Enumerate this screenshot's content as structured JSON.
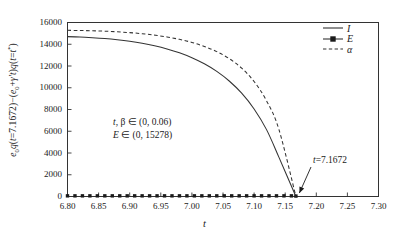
{
  "chart_data": {
    "type": "line",
    "title": "",
    "xlabel": "t",
    "ylabel": "e₀q(t=7.1672)−(e₀+γ't)q(t=t*)",
    "xlim": [
      6.8,
      7.3
    ],
    "ylim": [
      0,
      16000
    ],
    "xticks": [
      "6.80",
      "6.85",
      "6.90",
      "6.95",
      "7.00",
      "7.05",
      "7.10",
      "7.15",
      "7.20",
      "7.25",
      "7.30"
    ],
    "xtick_values": [
      6.8,
      6.85,
      6.9,
      6.95,
      7.0,
      7.05,
      7.1,
      7.15,
      7.2,
      7.25,
      7.3
    ],
    "yticks": [
      "0",
      "2000",
      "4000",
      "6000",
      "8000",
      "10000",
      "12000",
      "14000",
      "16000"
    ],
    "ytick_values": [
      0,
      2000,
      4000,
      6000,
      8000,
      10000,
      12000,
      14000,
      16000
    ],
    "grid": false,
    "legend_position": "top-right",
    "series": [
      {
        "name": "I",
        "style": "solid",
        "marker": "none",
        "color": "#333333",
        "x": [
          6.8,
          6.82,
          6.84,
          6.86,
          6.88,
          6.9,
          6.92,
          6.94,
          6.96,
          6.98,
          7.0,
          7.02,
          7.04,
          7.06,
          7.08,
          7.1,
          7.12,
          7.14,
          7.1672
        ],
        "values": [
          14700,
          14660,
          14600,
          14520,
          14410,
          14270,
          14090,
          13860,
          13570,
          13210,
          12760,
          12200,
          11500,
          10620,
          9500,
          8050,
          6150,
          3600,
          0
        ]
      },
      {
        "name": "E",
        "style": "solid",
        "marker": "square",
        "color": "#1a1a1a",
        "x": [
          6.8,
          6.812,
          6.824,
          6.836,
          6.848,
          6.86,
          6.872,
          6.884,
          6.896,
          6.908,
          6.92,
          6.932,
          6.944,
          6.956,
          6.968,
          6.98,
          6.992,
          7.004,
          7.016,
          7.028,
          7.04,
          7.052,
          7.064,
          7.076,
          7.088,
          7.1,
          7.112,
          7.124,
          7.136,
          7.148,
          7.16,
          7.1672
        ],
        "values": [
          60,
          60,
          60,
          60,
          60,
          60,
          60,
          60,
          60,
          60,
          60,
          60,
          60,
          60,
          60,
          60,
          60,
          60,
          60,
          60,
          60,
          60,
          60,
          60,
          60,
          60,
          60,
          60,
          60,
          60,
          60,
          40
        ]
      },
      {
        "name": "α",
        "style": "dashed",
        "marker": "none",
        "color": "#333333",
        "x": [
          6.8,
          6.82,
          6.84,
          6.86,
          6.88,
          6.9,
          6.92,
          6.94,
          6.96,
          6.98,
          7.0,
          7.02,
          7.04,
          7.06,
          7.08,
          7.1,
          7.12,
          7.14,
          7.1672
        ],
        "values": [
          15278,
          15265,
          15240,
          15200,
          15145,
          15070,
          14970,
          14840,
          14670,
          14450,
          14170,
          13800,
          13320,
          12680,
          11800,
          10570,
          8800,
          6150,
          0
        ]
      }
    ],
    "annotations": [
      {
        "id": "param-ranges",
        "line1_prefix": "t",
        "line1_rest": ", β ∈ (0,  0.06)",
        "line2_prefix": "E",
        "line2_rest": " ∈ (0,  15278)"
      },
      {
        "id": "convergence-point",
        "label_italic": "t",
        "label_rest": "=7.1672",
        "x": 7.1672,
        "y": 0
      }
    ]
  },
  "legend": {
    "items": [
      {
        "label": "I",
        "style": "solid",
        "marker": "none"
      },
      {
        "label": "E",
        "style": "solid",
        "marker": "square"
      },
      {
        "label": "α",
        "style": "dashed",
        "marker": "none"
      }
    ]
  }
}
